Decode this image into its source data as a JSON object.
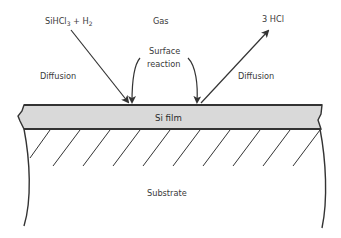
{
  "diagram": {
    "labels": {
      "reactant_main": "SiHCl",
      "reactant_sub": "3",
      "reactant_plus": " + H",
      "reactant_h_sub": "2",
      "gas": "Gas",
      "surface_line1": "Surface",
      "surface_line2": "reaction",
      "product": "3 HCl",
      "diffusion_left": "Diffusion",
      "diffusion_right": "Diffusion",
      "film": "Si film",
      "substrate": "Substrate"
    },
    "colors": {
      "film_fill": "#d9d9d9",
      "stroke": "#333333",
      "text": "#3a3a3a"
    }
  }
}
